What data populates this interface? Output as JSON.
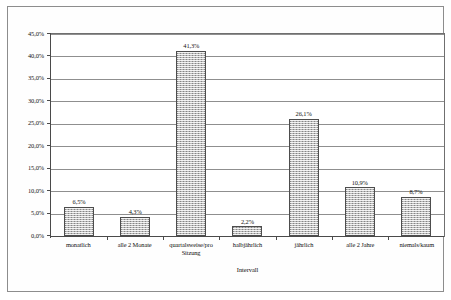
{
  "chart_data": {
    "type": "bar",
    "title": "",
    "xlabel": "Intervall",
    "ylabel": "",
    "categories": [
      "monatlich",
      "alle 2 Monate",
      "quartalsweise/pro Sitzung",
      "halbjährlich",
      "jährlich",
      "alle 2 Jahre",
      "niemals/kaum"
    ],
    "values": [
      6.5,
      4.3,
      41.3,
      2.2,
      26.1,
      10.9,
      8.7
    ],
    "value_labels": [
      "6,5%",
      "4,3%",
      "41,3%",
      "2,2%",
      "26,1%",
      "10,9%",
      "8,7%"
    ],
    "ylim": [
      0,
      45
    ],
    "ytick_values": [
      0,
      5,
      10,
      15,
      20,
      25,
      30,
      35,
      40,
      45
    ],
    "ytick_labels": [
      "0,0%",
      "5,0%",
      "10,0%",
      "15,0%",
      "20,0%",
      "25,0%",
      "30,0%",
      "35,0%",
      "40,0%",
      "45,0%"
    ],
    "grid": true,
    "legend": false,
    "bar_color": "#b9b9b9",
    "bar_border_color": "#4d4d4d",
    "axis_color": "#4a4a4a",
    "gridline_color": "#8f8f8f"
  }
}
